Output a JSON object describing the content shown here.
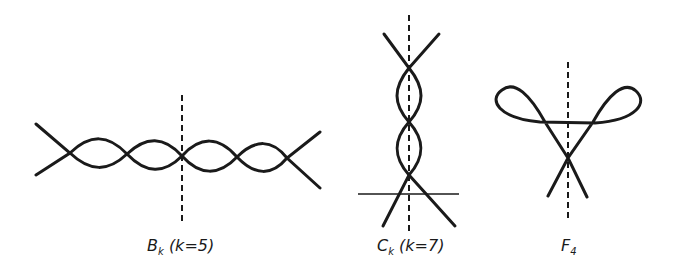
{
  "figures": [
    {
      "id": "B",
      "letter": "B",
      "subscript": "k",
      "param": "(k=5)"
    },
    {
      "id": "C",
      "letter": "C",
      "subscript": "k",
      "param": "(k=7)"
    },
    {
      "id": "F",
      "letter": "F",
      "subscript": "4",
      "param": ""
    }
  ],
  "colors": {
    "ink": "#1a1a1a",
    "background": "#ffffff"
  }
}
